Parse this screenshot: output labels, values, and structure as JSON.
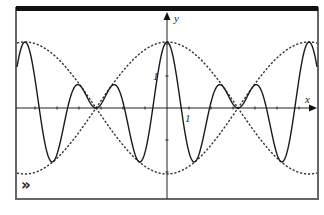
{
  "chart_data": {
    "type": "line",
    "title": "",
    "xlabel": "x",
    "ylabel": "y",
    "tick_labels": {
      "x_unit": "1",
      "y_unit": "1"
    },
    "xlim": [
      -7.6,
      6.9
    ],
    "ylim": [
      -2.8,
      2.9
    ],
    "grid": false,
    "legend": null,
    "series": [
      {
        "name": "y = 2cos(x·π/6.45)·cos(5·x·π/6.45)",
        "style": "solid",
        "description": "modulated carrier (beats)",
        "envelope_amplitude": 2,
        "envelope_nodes_x": [
          -3.2,
          3.2
        ],
        "carrier_to_envelope_ratio": 5
      },
      {
        "name": "y = 2cos(x·π/6.45)",
        "style": "dashed",
        "description": "upper envelope"
      },
      {
        "name": "y = -2cos(x·π/6.45)",
        "style": "dashed",
        "description": "lower envelope"
      }
    ],
    "key_points": {
      "maxima_x": [
        -6.45,
        0,
        6.45
      ],
      "max_y": 2,
      "envelope_nodes": [
        [
          -3.2,
          0
        ],
        [
          3.2,
          0
        ]
      ]
    }
  },
  "axes": {
    "x_label": "x",
    "y_label": "y",
    "x_tick_label": "1",
    "y_tick_label": "1"
  },
  "icons": {
    "expand": "»"
  },
  "colors": {
    "curve": "#1a1a1a",
    "envelope": "#333333",
    "frame": "#555555",
    "background": "#ffffff"
  }
}
